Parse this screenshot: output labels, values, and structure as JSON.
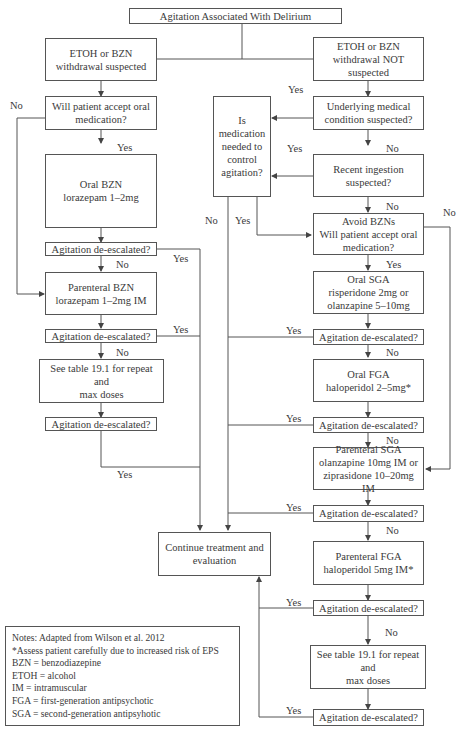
{
  "title": "Agitation Associated With Delirium",
  "boxes": {
    "withdrawal_suspected": "ETOH or BZN\nwithdrawal suspected",
    "withdrawal_not_suspected": "ETOH or BZN\nwithdrawal NOT\nsuspected",
    "left_accept_oral": "Will patient accept oral\nmedication?",
    "oral_bzn": "Oral BZN\nlorazepam 1–2mg",
    "left_deescalated_1": "Agitation de-escalated?",
    "parenteral_bzn": "Parenteral BZN\nlorazepam 1–2mg IM",
    "left_deescalated_2": "Agitation de-escalated?",
    "left_see_table": "See table 19.1 for repeat and\nmax doses",
    "left_deescalated_3": "Agitation de-escalated?",
    "medication_needed": "Is\nmedication\nneeded to\ncontrol\nagitation?",
    "underlying_condition": "Underlying medical\ncondition suspected?",
    "recent_ingestion": "Recent ingestion\nsuspected?",
    "avoid_bzn_accept_oral": "Avoid BZNs\nWill patient accept oral\nmedication?",
    "oral_sga": "Oral SGA\nrisperidone 2mg or\nolanzapine 5–10mg",
    "right_deescalated_1": "Agitation de-escalated?",
    "oral_fga": "Oral FGA\nhaloperidol 2–5mg*",
    "right_deescalated_2": "Agitation de-escalated?",
    "parenteral_sga": "Parenteral SGA\nolanzapine 10mg IM or\nziprasidone 10–20mg IM",
    "right_deescalated_3": "Agitation de-escalated?",
    "parenteral_fga": "Parenteral FGA\nhaloperidol 5mg IM*",
    "right_deescalated_4": "Agitation de-escalated?",
    "right_see_table": "See table 19.1 for repeat and\nmax doses",
    "right_deescalated_5": "Agitation de-escalated?",
    "continue_treatment": "Continue treatment and\nevaluation"
  },
  "labels": {
    "yes": "Yes",
    "no": "No"
  },
  "notes": {
    "lines": [
      "Notes: Adapted from Wilson et al. 2012",
      "*Assess patient carefully due to increased risk of EPS",
      "BZN = benzodiazepine",
      "ETOH = alcohol",
      "IM = intramuscular",
      "FGA = first-generation antipsychotic",
      "SGA = second-generation antipsyhotic"
    ]
  }
}
